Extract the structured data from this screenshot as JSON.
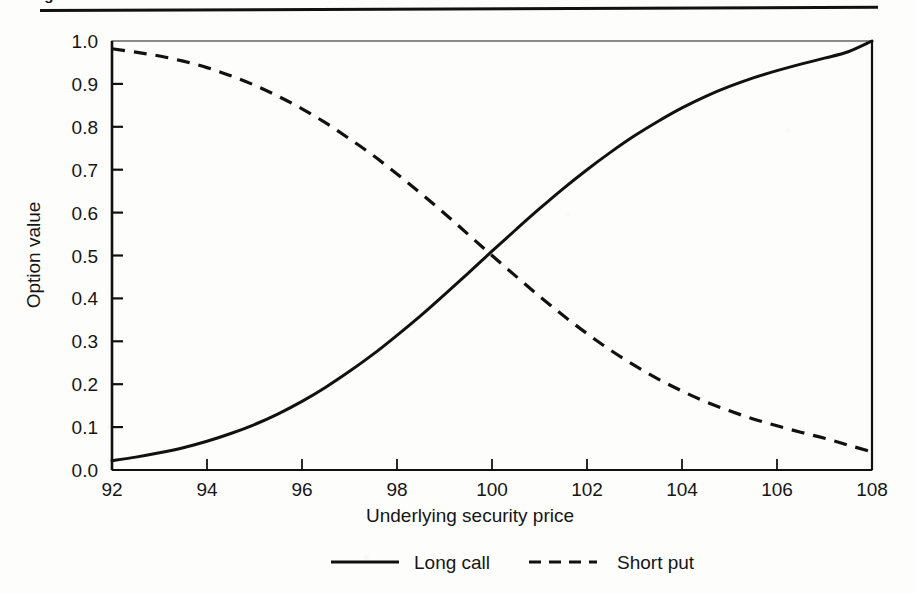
{
  "figure": {
    "caption_fragment": "igure",
    "background_color": "#fdfdfc",
    "ink_color": "#111111"
  },
  "chart_data": {
    "type": "line",
    "title": "",
    "xlabel": "Underlying security price",
    "ylabel": "Option value",
    "xlim": [
      92,
      108
    ],
    "ylim": [
      0.0,
      1.0
    ],
    "grid": false,
    "legend_position": "bottom-center",
    "xticks": [
      92,
      94,
      96,
      98,
      100,
      102,
      104,
      106,
      108
    ],
    "xtick_labels": [
      "92",
      "94",
      "96",
      "98",
      "100",
      "102",
      "104",
      "106",
      "108"
    ],
    "yticks": [
      0.0,
      0.1,
      0.2,
      0.3,
      0.4,
      0.5,
      0.6,
      0.7,
      0.8,
      0.9,
      1.0
    ],
    "ytick_labels": [
      "0.0",
      "0.1",
      "0.2",
      "0.3",
      "0.4",
      "0.5",
      "0.6",
      "0.7",
      "0.8",
      "0.9",
      "1.0"
    ],
    "x": [
      92,
      92.5,
      93,
      93.5,
      94,
      94.5,
      95,
      95.5,
      96,
      96.5,
      97,
      97.5,
      98,
      98.5,
      99,
      99.5,
      100,
      100.5,
      101,
      101.5,
      102,
      102.5,
      103,
      103.5,
      104,
      104.5,
      105,
      105.5,
      106,
      106.5,
      107,
      107.5,
      108
    ],
    "series": [
      {
        "name": "Long call",
        "linestyle": "solid",
        "color": "#111111",
        "values": [
          0.022,
          0.03,
          0.04,
          0.052,
          0.067,
          0.085,
          0.106,
          0.131,
          0.16,
          0.193,
          0.23,
          0.27,
          0.314,
          0.36,
          0.409,
          0.459,
          0.51,
          0.56,
          0.609,
          0.656,
          0.7,
          0.741,
          0.779,
          0.813,
          0.844,
          0.871,
          0.894,
          0.914,
          0.931,
          0.946,
          0.96,
          0.975,
          1.0
        ]
      },
      {
        "name": "Short put",
        "linestyle": "dashed",
        "color": "#111111",
        "values": [
          0.982,
          0.974,
          0.965,
          0.953,
          0.938,
          0.919,
          0.897,
          0.871,
          0.842,
          0.809,
          0.772,
          0.733,
          0.69,
          0.645,
          0.598,
          0.549,
          0.5,
          0.452,
          0.405,
          0.36,
          0.318,
          0.279,
          0.244,
          0.212,
          0.184,
          0.159,
          0.138,
          0.119,
          0.103,
          0.088,
          0.074,
          0.058,
          0.042
        ]
      }
    ],
    "annotations": [
      {
        "text": "curves cross at (100, 0.50)",
        "x": 100,
        "y": 0.5
      }
    ]
  },
  "legend": {
    "items": [
      {
        "label": "Long call",
        "linestyle": "solid"
      },
      {
        "label": "Short put",
        "linestyle": "dashed"
      }
    ]
  }
}
